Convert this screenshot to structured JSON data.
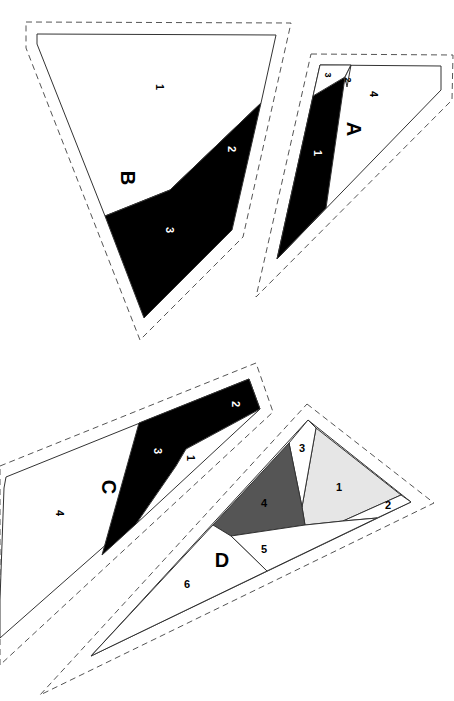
{
  "diagram": {
    "type": "foundation-paper-piecing-pattern",
    "corner_mark": "",
    "colors": {
      "black": "#000000",
      "dark_gray": "#555555",
      "light_gray": "#e6e6e6",
      "white": "#ffffff",
      "line": "#333333",
      "dashed": "#555555"
    },
    "sections": {
      "A": {
        "label": "A",
        "pieces": [
          {
            "num": "1",
            "fill": "black"
          },
          {
            "num": "2",
            "fill": "white"
          },
          {
            "num": "3",
            "fill": "white"
          },
          {
            "num": "4",
            "fill": "white"
          }
        ]
      },
      "B": {
        "label": "B",
        "pieces": [
          {
            "num": "1",
            "fill": "white"
          },
          {
            "num": "2",
            "fill": "black"
          },
          {
            "num": "3",
            "fill": "black"
          }
        ]
      },
      "C": {
        "label": "C",
        "pieces": [
          {
            "num": "1",
            "fill": "white"
          },
          {
            "num": "2",
            "fill": "black"
          },
          {
            "num": "3",
            "fill": "black"
          },
          {
            "num": "4",
            "fill": "white"
          }
        ]
      },
      "D": {
        "label": "D",
        "pieces": [
          {
            "num": "1",
            "fill": "light_gray"
          },
          {
            "num": "2",
            "fill": "white"
          },
          {
            "num": "3",
            "fill": "white"
          },
          {
            "num": "4",
            "fill": "dark_gray"
          },
          {
            "num": "5",
            "fill": "white"
          },
          {
            "num": "6",
            "fill": "white"
          }
        ]
      }
    }
  }
}
